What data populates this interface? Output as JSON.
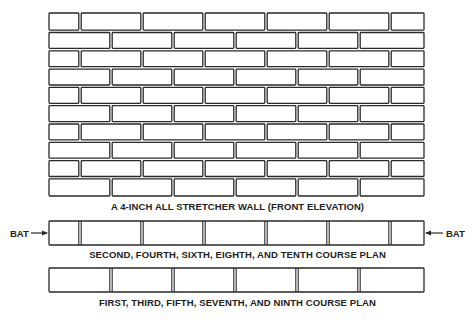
{
  "diagram": {
    "title": "A 4-INCH ALL STRETCHER WALL (FRONT ELEVATION)",
    "elevation": {
      "courses": 10,
      "x_left": 49,
      "x_right": 424,
      "y_top": 13,
      "y_bottom": 196,
      "pattern_a_joints": [
        80,
        142,
        204,
        266,
        328,
        390
      ],
      "pattern_b_joints": [
        111,
        173,
        235,
        297,
        359
      ],
      "course_patterns": [
        "A",
        "B",
        "A",
        "B",
        "A",
        "B",
        "A",
        "B",
        "A",
        "B"
      ]
    },
    "plans": [
      {
        "id": "even-course-plan",
        "caption": "SECOND, FOURTH, SIXTH, EIGHTH, AND TENTH COURSE PLAN",
        "y_top": 221,
        "y_bottom": 245,
        "joints": [
          80,
          142,
          204,
          266,
          328,
          390
        ],
        "left_label": "BAT",
        "right_label": "BAT"
      },
      {
        "id": "odd-course-plan",
        "caption": "FIRST, THIRD, FIFTH, SEVENTH, AND NINTH COURSE PLAN",
        "y_top": 268,
        "y_bottom": 292,
        "joints": [
          111,
          173,
          235,
          297,
          359
        ]
      }
    ],
    "colors": {
      "line": "#2a2a2a",
      "mortar": "#ffffff",
      "background": "#ffffff"
    }
  }
}
